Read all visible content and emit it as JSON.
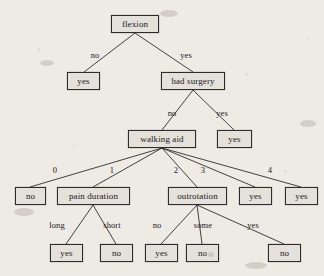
{
  "figure": {
    "type": "decision-tree",
    "background_color": "#eeeae4",
    "node_fill": "#e4e0da",
    "node_border": "#2c2c2c",
    "edge_color": "#2e2e2e"
  },
  "nodes": [
    {
      "id": "n0",
      "label": "flexion",
      "kind": "internal",
      "x": 111,
      "y": 15,
      "w": 48,
      "h": 18
    },
    {
      "id": "n1",
      "label": "yes",
      "kind": "leaf",
      "x": 67,
      "y": 72,
      "w": 33,
      "h": 18
    },
    {
      "id": "n2",
      "label": "had surgery",
      "kind": "internal",
      "x": 161,
      "y": 72,
      "w": 64,
      "h": 18
    },
    {
      "id": "n3",
      "label": "walking aid",
      "kind": "internal",
      "x": 128,
      "y": 130,
      "w": 68,
      "h": 18
    },
    {
      "id": "n4",
      "label": "yes",
      "kind": "leaf",
      "x": 217,
      "y": 130,
      "w": 35,
      "h": 18
    },
    {
      "id": "n5",
      "label": "no",
      "kind": "leaf",
      "x": 15,
      "y": 187,
      "w": 31,
      "h": 18
    },
    {
      "id": "n6",
      "label": "pain duration",
      "kind": "internal",
      "x": 57,
      "y": 187,
      "w": 73,
      "h": 18
    },
    {
      "id": "n7",
      "label": "outrotation",
      "kind": "internal",
      "x": 168,
      "y": 187,
      "w": 59,
      "h": 18
    },
    {
      "id": "n8",
      "label": "yes",
      "kind": "leaf",
      "x": 239,
      "y": 187,
      "w": 33,
      "h": 18
    },
    {
      "id": "n9",
      "label": "yes",
      "kind": "leaf",
      "x": 285,
      "y": 187,
      "w": 33,
      "h": 18
    },
    {
      "id": "n10",
      "label": "yes",
      "kind": "leaf",
      "x": 50,
      "y": 244,
      "w": 33,
      "h": 18
    },
    {
      "id": "n11",
      "label": "no",
      "kind": "leaf",
      "x": 100,
      "y": 244,
      "w": 33,
      "h": 18
    },
    {
      "id": "n12",
      "label": "yes",
      "kind": "leaf",
      "x": 145,
      "y": 244,
      "w": 33,
      "h": 18
    },
    {
      "id": "n13",
      "label": "no",
      "kind": "leaf",
      "x": 186,
      "y": 244,
      "w": 33,
      "h": 18
    },
    {
      "id": "n14",
      "label": "no",
      "kind": "leaf",
      "x": 268,
      "y": 244,
      "w": 33,
      "h": 18
    }
  ],
  "edges": [
    {
      "from": "n0",
      "to": "n1",
      "label": "no",
      "lx": 95,
      "ly": 55,
      "x1": 135,
      "y1": 33,
      "x2": 84,
      "y2": 72
    },
    {
      "from": "n0",
      "to": "n2",
      "label": "yes",
      "lx": 186,
      "ly": 55,
      "x1": 135,
      "y1": 33,
      "x2": 193,
      "y2": 72
    },
    {
      "from": "n2",
      "to": "n3",
      "label": "no",
      "lx": 172,
      "ly": 113,
      "x1": 193,
      "y1": 90,
      "x2": 162,
      "y2": 130
    },
    {
      "from": "n2",
      "to": "n4",
      "label": "yes",
      "lx": 222,
      "ly": 113,
      "x1": 193,
      "y1": 90,
      "x2": 234,
      "y2": 130
    },
    {
      "from": "n3",
      "to": "n5",
      "label": "0",
      "lx": 55,
      "ly": 170,
      "x1": 162,
      "y1": 148,
      "x2": 30,
      "y2": 187
    },
    {
      "from": "n3",
      "to": "n6",
      "label": "1",
      "lx": 112,
      "ly": 170,
      "x1": 162,
      "y1": 148,
      "x2": 93,
      "y2": 187
    },
    {
      "from": "n3",
      "to": "n7",
      "label": "2",
      "lx": 176,
      "ly": 170,
      "x1": 162,
      "y1": 148,
      "x2": 197,
      "y2": 187
    },
    {
      "from": "n3",
      "to": "n8",
      "label": "3",
      "lx": 203,
      "ly": 170,
      "x1": 162,
      "y1": 148,
      "x2": 255,
      "y2": 187
    },
    {
      "from": "n3",
      "to": "n9",
      "label": "4",
      "lx": 270,
      "ly": 170,
      "x1": 162,
      "y1": 148,
      "x2": 301,
      "y2": 187
    },
    {
      "from": "n6",
      "to": "n10",
      "label": "long",
      "lx": 57,
      "ly": 225,
      "x1": 93,
      "y1": 205,
      "x2": 66,
      "y2": 244
    },
    {
      "from": "n6",
      "to": "n11",
      "label": "short",
      "lx": 112,
      "ly": 225,
      "x1": 93,
      "y1": 205,
      "x2": 116,
      "y2": 244
    },
    {
      "from": "n7",
      "to": "n12",
      "label": "no",
      "lx": 157,
      "ly": 225,
      "x1": 197,
      "y1": 205,
      "x2": 161,
      "y2": 244
    },
    {
      "from": "n7",
      "to": "n13",
      "label": "some",
      "lx": 203,
      "ly": 225,
      "x1": 197,
      "y1": 205,
      "x2": 202,
      "y2": 244
    },
    {
      "from": "n7",
      "to": "n14",
      "label": "yes",
      "lx": 253,
      "ly": 225,
      "x1": 197,
      "y1": 205,
      "x2": 284,
      "y2": 244
    }
  ],
  "artifacts": [
    {
      "x": 208,
      "y": 252,
      "w": 6,
      "h": 5
    },
    {
      "x": 160,
      "y": 10,
      "w": 18,
      "h": 7
    },
    {
      "x": 40,
      "y": 60,
      "w": 14,
      "h": 6
    },
    {
      "x": 300,
      "y": 120,
      "w": 16,
      "h": 7
    },
    {
      "x": 14,
      "y": 208,
      "w": 20,
      "h": 8
    },
    {
      "x": 245,
      "y": 262,
      "w": 22,
      "h": 7
    }
  ]
}
